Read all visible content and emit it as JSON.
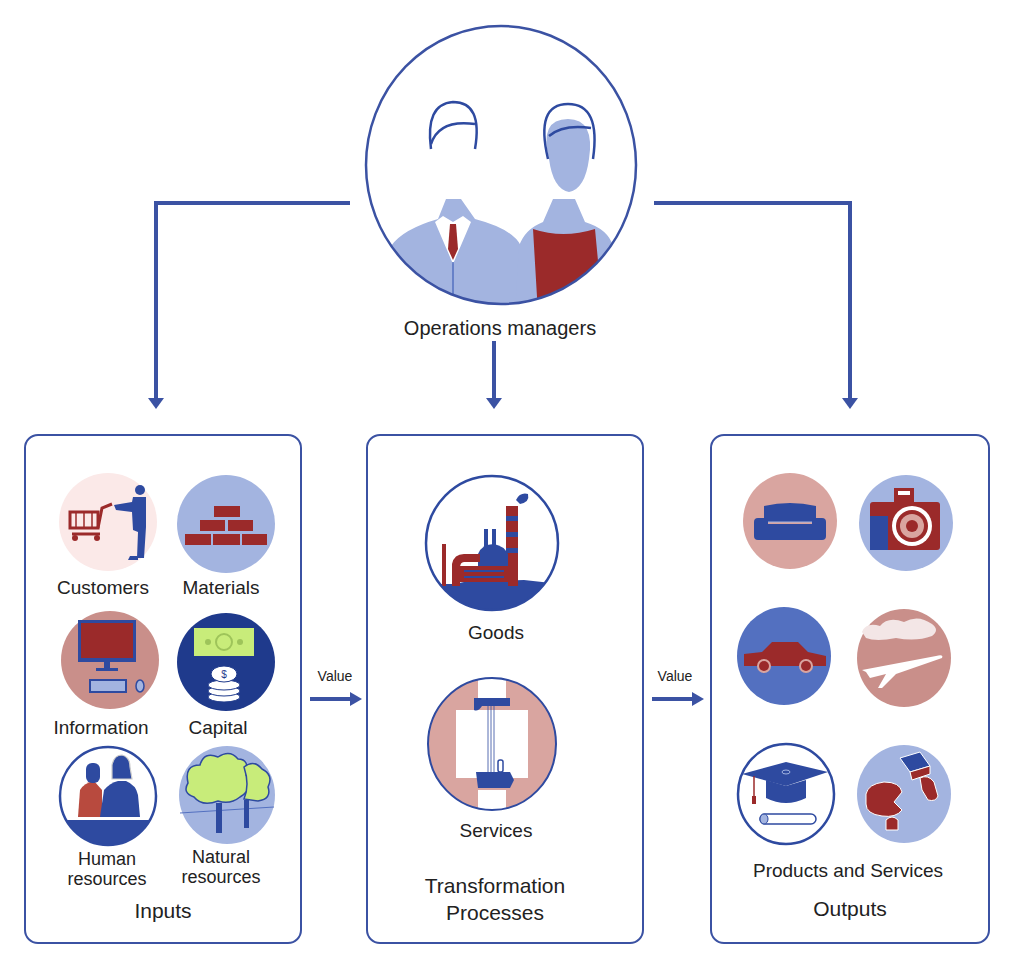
{
  "colors": {
    "line_blue": "#3b52a3",
    "dark_blue": "#2e4aa0",
    "light_blue": "#a3b4e0",
    "mid_blue": "#5370c0",
    "maroon": "#9b2a2a",
    "pink": "#d9a5a0",
    "lime": "#c8ec7a",
    "navy": "#1f3a8c"
  },
  "manager": {
    "label": "Operations managers",
    "icon": "operations-managers-icon"
  },
  "inputs": {
    "title": "Inputs",
    "items": [
      {
        "label": "Customers",
        "icon": "customer-cart-icon"
      },
      {
        "label": "Materials",
        "icon": "bricks-icon"
      },
      {
        "label": "Information",
        "icon": "computer-icon"
      },
      {
        "label": "Capital",
        "icon": "money-coins-icon"
      },
      {
        "label_line1": "Human",
        "label_line2": "resources",
        "icon": "people-icon"
      },
      {
        "label_line1": "Natural",
        "label_line2": "resources",
        "icon": "trees-icon"
      }
    ]
  },
  "arrows": {
    "left_value": "Value",
    "right_value": "Value"
  },
  "transformation": {
    "title_line1": "Transformation",
    "title_line2": "Processes",
    "items": [
      {
        "label": "Goods",
        "icon": "factory-icon"
      },
      {
        "label": "Services",
        "icon": "handshake-service-icon"
      }
    ]
  },
  "outputs": {
    "subtitle": "Products and Services",
    "title": "Outputs",
    "items": [
      {
        "icon": "sofa-icon"
      },
      {
        "icon": "camera-icon"
      },
      {
        "icon": "car-icon"
      },
      {
        "icon": "airplane-icon"
      },
      {
        "icon": "graduation-cap-icon"
      },
      {
        "icon": "cheese-food-icon"
      }
    ]
  }
}
